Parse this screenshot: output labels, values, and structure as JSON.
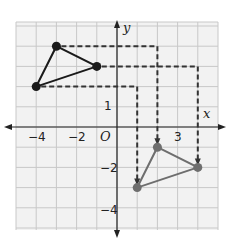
{
  "figure": {
    "background": "#ffffff",
    "grid_color": "#c8c8c8",
    "grid_background": "#f2f2f2",
    "axis_color": "#222222",
    "dash_color": "#333333"
  },
  "axes": {
    "x_label": "x",
    "y_label": "y",
    "origin_label": "O",
    "x_ticks": [
      {
        "value": -4,
        "label": "−4"
      },
      {
        "value": -2,
        "label": "−2"
      },
      {
        "value": 3,
        "label": "3"
      }
    ],
    "y_ticks": [
      {
        "value": 1,
        "label": "1"
      },
      {
        "value": -2,
        "label": "−2"
      },
      {
        "value": -4,
        "label": "−4"
      }
    ],
    "xlim": [
      -5,
      5
    ],
    "ylim": [
      -5,
      5
    ]
  },
  "chart_data": {
    "type": "scatter",
    "title": "",
    "xlabel": "x",
    "ylabel": "y",
    "xlim": [
      -5,
      5
    ],
    "ylim": [
      -5,
      5
    ],
    "grid": true,
    "series": [
      {
        "name": "original triangle",
        "color": "#1a1a1a",
        "points": [
          [
            -3,
            4
          ],
          [
            -1,
            3
          ],
          [
            -4,
            2
          ]
        ]
      },
      {
        "name": "translated triangle",
        "color": "#6e6e6e",
        "points": [
          [
            2,
            -1
          ],
          [
            4,
            -2
          ],
          [
            1,
            -3
          ]
        ]
      }
    ],
    "translation_paths": [
      {
        "from": [
          -3,
          4
        ],
        "corner": [
          2,
          4
        ],
        "to": [
          2,
          -1
        ]
      },
      {
        "from": [
          -1,
          3
        ],
        "corner": [
          4,
          3
        ],
        "to": [
          4,
          -2
        ]
      },
      {
        "from": [
          -4,
          2
        ],
        "corner": [
          1,
          2
        ],
        "to": [
          1,
          -3
        ]
      }
    ],
    "translation": "(x, y) → (x + 5, y − 5)"
  }
}
